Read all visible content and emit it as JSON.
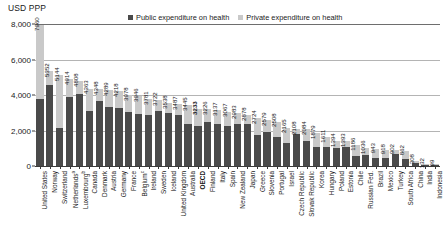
{
  "chart_data": {
    "type": "bar",
    "title": "",
    "subtitle": "",
    "xlabel": "",
    "ylabel": "USD PPP",
    "ylim": [
      0,
      8000
    ],
    "yticks": [
      0,
      2000,
      4000,
      6000,
      8000
    ],
    "ytick_labels": [
      "0",
      "2,000",
      "4,000",
      "6,000",
      "8,000"
    ],
    "grid": true,
    "stacked": true,
    "legend_position": "top-center",
    "legend": [
      {
        "name": "Public expenditure on health",
        "color": "#4a4a4a"
      },
      {
        "name": "Private expenditure on health",
        "color": "#c9c9c9"
      }
    ],
    "categories": [
      "United States",
      "Norway",
      "Switzerland",
      "Netherlands",
      "Luxembourg",
      "Canada",
      "Denmark",
      "Austria",
      "Germany",
      "France",
      "Belgium",
      "Ireland",
      "Sweden",
      "Iceland",
      "United Kingdom",
      "Australia",
      "OECD",
      "Finland",
      "Italy",
      "Spain",
      "New Zealand",
      "Japan",
      "Greece",
      "Slovenia",
      "Portugal",
      "Israel",
      "Czech Republic",
      "Slovak Republic",
      "Korea",
      "Hungary",
      "Poland",
      "Estonia",
      "Chile",
      "Russian Fed.",
      "Brazil",
      "Mexico",
      "Turkey",
      "South Africa",
      "China",
      "India",
      "Indonesia"
    ],
    "category_footnotes": {
      "Netherlands": "a",
      "Luxembourg": "b",
      "Belgium": "c"
    },
    "highlight_category": "OECD",
    "totals": [
      7960,
      5352,
      5144,
      4914,
      4808,
      4363,
      4348,
      4289,
      4218,
      3978,
      3946,
      3781,
      3722,
      3538,
      3487,
      3445,
      3233,
      3226,
      3137,
      3067,
      2983,
      2878,
      2724,
      2579,
      2508,
      2165,
      2108,
      2084,
      1879,
      1611,
      1394,
      1393,
      1186,
      1036,
      943,
      918,
      902,
      862,
      308,
      132,
      99
    ],
    "series": [
      {
        "name": "Public expenditure on health",
        "color": "#4a4a4a",
        "values": [
          3795,
          4542,
          2128,
          3896,
          4039,
          3122,
          3666,
          3340,
          3268,
          3058,
          2946,
          2862,
          3094,
          2970,
          2874,
          2340,
          2280,
          2461,
          2347,
          2246,
          2390,
          2393,
          1731,
          1932,
          1650,
          1320,
          1782,
          1412,
          1045,
          1054,
          988,
          1046,
          580,
          629,
          435,
          442,
          671,
          404,
          171,
          39,
          38
        ]
      },
      {
        "name": "Private expenditure on health",
        "color": "#c9c9c9",
        "values": [
          4165,
          810,
          3016,
          1018,
          769,
          1241,
          682,
          949,
          950,
          920,
          1000,
          919,
          628,
          568,
          613,
          1105,
          953,
          765,
          790,
          821,
          593,
          485,
          993,
          647,
          858,
          845,
          326,
          672,
          834,
          557,
          406,
          347,
          606,
          407,
          508,
          476,
          231,
          458,
          137,
          93,
          61
        ]
      }
    ]
  }
}
